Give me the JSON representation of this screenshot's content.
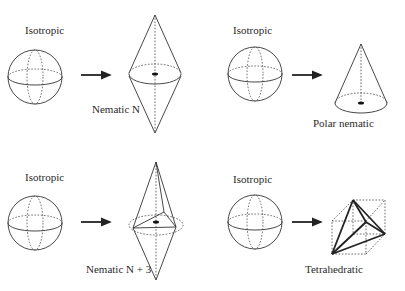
{
  "panels": [
    {
      "id": "nematic",
      "from_label": "Isotropic",
      "to_label": "Nematic N",
      "shape": "bicone"
    },
    {
      "id": "polar",
      "from_label": "Isotropic",
      "to_label": "Polar nematic",
      "shape": "cone"
    },
    {
      "id": "nematic-n3",
      "from_label": "Isotropic",
      "to_label": "Nematic N + 3",
      "shape": "bicone-with-triangle"
    },
    {
      "id": "tetrahedratic",
      "from_label": "Isotropic",
      "to_label": "Tetrahedratic",
      "shape": "tetrahedron-in-cube"
    }
  ],
  "colors": {
    "stroke": "#333333",
    "background": "#ffffff"
  }
}
